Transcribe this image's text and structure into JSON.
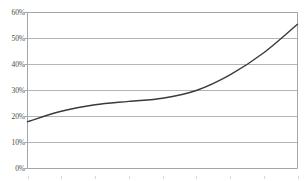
{
  "chart_data": {
    "type": "line",
    "title": "",
    "subtitle": "",
    "xlabel": "",
    "ylabel": "",
    "legend": [],
    "legend_position": "none",
    "grid": true,
    "grid_axis": "y",
    "ylim": [
      0,
      60
    ],
    "ytick_labels": [
      "60%",
      "50%",
      "40%",
      "30%",
      "20%",
      "10%",
      "0%"
    ],
    "ytick_values": [
      60,
      50,
      40,
      30,
      20,
      10,
      0
    ],
    "xtick_labels": [],
    "x": [
      0,
      1,
      2,
      3,
      4,
      5,
      6,
      7,
      8
    ],
    "series": [
      {
        "name": "series-1",
        "values": [
          18,
          22,
          24.5,
          25.8,
          27,
          30,
          36,
          44.5,
          55.5
        ],
        "color": "#3a3a3a"
      }
    ],
    "annotations": []
  },
  "style": {
    "background": "#ffffff",
    "gridline_color": "#b5b5b5",
    "axis_color": "#a6a6a6",
    "text_color": "#4a4a4a",
    "line_color": "#3a3a3a"
  }
}
